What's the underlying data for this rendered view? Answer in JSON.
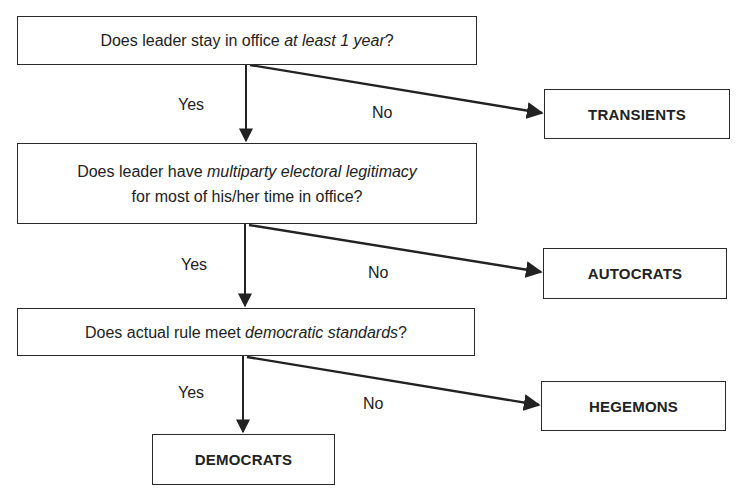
{
  "diagram": {
    "questions": [
      {
        "pre": "Does leader stay in office ",
        "em": "at least 1 year",
        "post": "?"
      },
      {
        "line1_pre": "Does leader have ",
        "line1_em": "multiparty electoral legitimacy",
        "line2": "for most of his/her time in office?"
      },
      {
        "pre": "Does actual rule meet ",
        "em": "democratic standards",
        "post": "?"
      }
    ],
    "outcomes": {
      "transients": "TRANSIENTS",
      "autocrats": "AUTOCRATS",
      "hegemons": "HEGEMONS",
      "democrats": "DEMOCRATS"
    },
    "edge_labels": {
      "yes": "Yes",
      "no": "No"
    },
    "colors": {
      "stroke": "#2a2a2a",
      "background": "#ffffff"
    }
  }
}
